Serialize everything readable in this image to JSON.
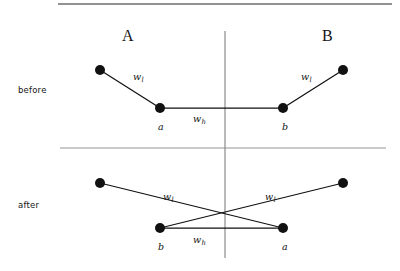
{
  "figure": {
    "width": 400,
    "height": 271,
    "background": "#ffffff",
    "ink_color": "#111111",
    "rule_color": "#8c8c8c",
    "top_rule_color": "#6e6e6e"
  },
  "columns": [
    {
      "id": "A",
      "label": "A",
      "x": 122,
      "y": 28
    },
    {
      "id": "B",
      "label": "B",
      "x": 322,
      "y": 28
    }
  ],
  "rows": [
    {
      "id": "before",
      "label": "before",
      "x": 18,
      "y": 86
    },
    {
      "id": "after",
      "label": "after",
      "x": 18,
      "y": 201
    }
  ],
  "rules": {
    "top_border": {
      "x1": 58,
      "y1": 4,
      "x2": 392,
      "y2": 4
    },
    "mid_horizontal": {
      "x1": 60,
      "y1": 148,
      "x2": 386,
      "y2": 148
    },
    "vertical_divider": {
      "x1": 225,
      "y1": 31,
      "x2": 225,
      "y2": 258
    }
  },
  "chart_data": {
    "type": "diagram",
    "title": "",
    "node_radius": 5,
    "panels": [
      {
        "id": "before",
        "label": "before",
        "nodes": [
          {
            "id": "A_outer",
            "label": "",
            "x": 100,
            "y": 70,
            "community": "A"
          },
          {
            "id": "a",
            "label": "a",
            "x": 160,
            "y": 108,
            "community": "A",
            "label_x": 158,
            "label_y": 122
          },
          {
            "id": "b",
            "label": "b",
            "x": 283,
            "y": 108,
            "community": "B",
            "label_x": 282,
            "label_y": 122
          },
          {
            "id": "B_outer",
            "label": "",
            "x": 343,
            "y": 70,
            "community": "B"
          }
        ],
        "edges": [
          {
            "from": "A_outer",
            "to": "a",
            "weight_label": "w",
            "weight_sub": "l",
            "label_x": 133,
            "label_y": 72
          },
          {
            "from": "a",
            "to": "b",
            "weight_label": "w",
            "weight_sub": "h",
            "label_x": 193,
            "label_y": 114
          },
          {
            "from": "b",
            "to": "B_outer",
            "weight_label": "w",
            "weight_sub": "l",
            "label_x": 301,
            "label_y": 72
          }
        ]
      },
      {
        "id": "after",
        "label": "after",
        "nodes": [
          {
            "id": "A_outer",
            "label": "",
            "x": 100,
            "y": 183,
            "community": "A"
          },
          {
            "id": "b",
            "label": "b",
            "x": 160,
            "y": 228,
            "community": "A",
            "label_x": 158,
            "label_y": 242
          },
          {
            "id": "a",
            "label": "a",
            "x": 283,
            "y": 228,
            "community": "B",
            "label_x": 282,
            "label_y": 242
          },
          {
            "id": "B_outer",
            "label": "",
            "x": 343,
            "y": 183,
            "community": "B"
          }
        ],
        "edges": [
          {
            "from": "A_outer",
            "to": "a",
            "weight_label": "w",
            "weight_sub": "l",
            "label_x": 163,
            "label_y": 192
          },
          {
            "from": "b",
            "to": "a",
            "weight_label": "w",
            "weight_sub": "h",
            "label_x": 193,
            "label_y": 235
          },
          {
            "from": "B_outer",
            "to": "b",
            "weight_label": "w",
            "weight_sub": "l",
            "label_x": 265,
            "label_y": 192
          }
        ]
      }
    ]
  }
}
